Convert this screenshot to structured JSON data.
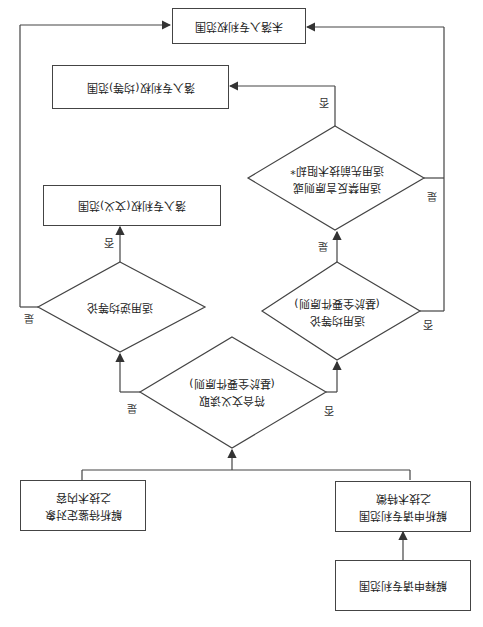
{
  "orientation": "rotated-180",
  "nodes": {
    "not_infringing": "未落入专利权范围",
    "infringing_equivalent": "落入专利权(均等)范围",
    "estoppel_or_prior_art": {
      "line1": "适用禁反言原则或",
      "line2": "适用先前技术阻却*"
    },
    "infringing_literal": "落入专利权(文义)范围",
    "reverse_doctrine": "适用逆均等论",
    "doctrine_of_equivalents": {
      "line1": "适用均等论",
      "line2": "(基於全要件原则)"
    },
    "literal_reading": {
      "line1": "符合文义读取",
      "line2": "(基於全要件原则)"
    },
    "analyze_accused": {
      "line1": "解析待鉴定对象",
      "line2": "之技术内容"
    },
    "analyze_claims": {
      "line1": "解析申请专利范围",
      "line2": "之技术特徵"
    },
    "interpret_claims": "解释申请专利范围"
  },
  "edge_labels": {
    "yes": "是",
    "no": "否"
  },
  "colors": {
    "line": "#444444",
    "background": "#ffffff"
  }
}
